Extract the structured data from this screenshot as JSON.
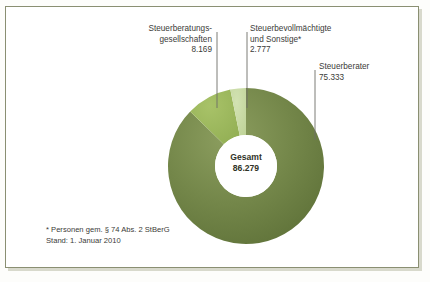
{
  "figure": {
    "background_color": "#ffffff",
    "frame_color": "#8a8f72"
  },
  "center": {
    "title": "Gesamt",
    "value": "86.279"
  },
  "labels": {
    "gesellschaften": {
      "line1": "Steuerberatungs-",
      "line2": "gesellschaften",
      "value": "8.169"
    },
    "bevollmaechtigte": {
      "line1": "Steuerbevollmächtigte",
      "line2": "und Sonstige*",
      "value": "2.777"
    },
    "berater": {
      "line1": "Steuerberater",
      "value": "75.333"
    }
  },
  "footnote": {
    "line1": "* Personen gem. § 74 Abs. 2 StBerG",
    "line2": "Stand: 1. Januar 2010"
  },
  "chart_data": {
    "type": "pie",
    "variant": "donut",
    "title": "",
    "total_label": "Gesamt",
    "total": 86279,
    "categories": [
      "Steuerberater",
      "Steuerberatungsgesellschaften",
      "Steuerbevollmächtigte und Sonstige*"
    ],
    "values": [
      75333,
      8169,
      2777
    ],
    "value_labels": [
      "75.333",
      "8.169",
      "2.777"
    ],
    "percentages": [
      87.3,
      9.5,
      3.2
    ],
    "colors": [
      "#6f8443",
      "#9cb85c",
      "#c6d9a0"
    ],
    "legend": "none",
    "annotations": [
      "* Personen gem. § 74 Abs. 2 StBerG",
      "Stand: 1. Januar 2010"
    ],
    "geometry": {
      "center_x": 246,
      "center_y": 166,
      "outer_radius": 78,
      "inner_radius": 31,
      "start_angle_deg": -90,
      "direction": "counterclockwise"
    }
  }
}
